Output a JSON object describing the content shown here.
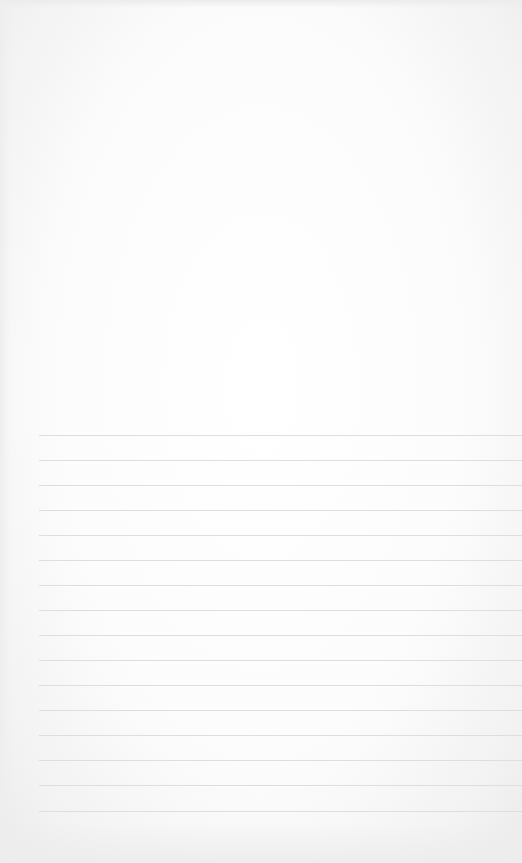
{
  "document": {
    "type": "lined-paper",
    "background_color": "#fdfdfd",
    "line_color": "#dedede",
    "line_count": 16,
    "line_start_x": 39,
    "line_positions_y": [
      435,
      460,
      485,
      510,
      535,
      560,
      585,
      610,
      635,
      660,
      685,
      710,
      735,
      760,
      785,
      811
    ]
  }
}
